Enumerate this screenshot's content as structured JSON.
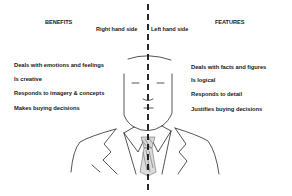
{
  "diagram": {
    "left_column": {
      "heading": "BENEFITS",
      "side_label": "Right hand side",
      "items": [
        "Deals with emotions and feelings",
        "Is creative",
        "Responds to imagery & concepts",
        "Makes buying decisions"
      ]
    },
    "right_column": {
      "heading": "FEATURES",
      "side_label": "Left hand side",
      "items": [
        "Deals with facts and figures",
        "Is logical",
        "Responds to detail",
        "Justifies buying decisions"
      ]
    },
    "figure": {
      "description": "Line drawing of a man in a suit and tie, split vertically by a dashed line",
      "divider_style": "dashed"
    },
    "colors": {
      "background": "#ffffff",
      "ink": "#1a1a1a",
      "divider": "#111111"
    }
  }
}
